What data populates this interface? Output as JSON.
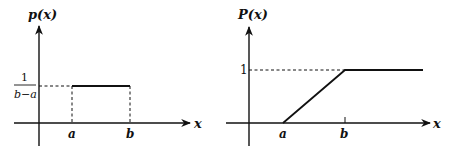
{
  "panels": [
    {
      "id": "pdf",
      "y_label": "p(x)",
      "x_label": "x",
      "level_label_num": "1",
      "level_label_den": "b−a",
      "tick_a": "a",
      "tick_b": "b",
      "description": "Uniform probability density: constant 1/(b-a) between a and b, zero elsewhere"
    },
    {
      "id": "cdf",
      "y_label": "P(x)",
      "x_label": "x",
      "level_label": "1",
      "tick_a": "a",
      "tick_b": "b",
      "description": "Uniform cumulative distribution: 0 before a, linear ramp from a to b, equals 1 after b"
    }
  ],
  "colors": {
    "ink": "#111111",
    "background": "#ffffff"
  }
}
